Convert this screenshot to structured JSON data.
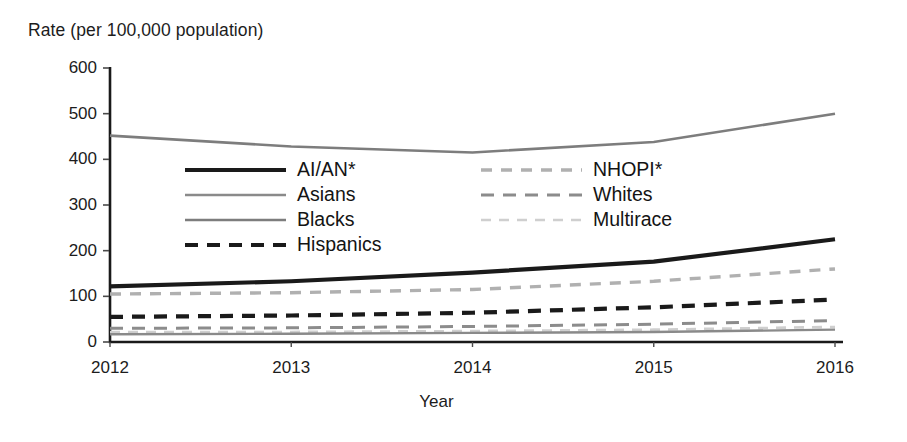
{
  "chart_data": {
    "type": "line",
    "title": "",
    "ylabel": "Rate (per 100,000 population)",
    "xlabel": "Year",
    "x": [
      2012,
      2013,
      2014,
      2015,
      2016
    ],
    "xtick_labels": [
      "2012",
      "2013",
      "2014",
      "2015",
      "2016"
    ],
    "ytick_labels": [
      "600",
      "500",
      "400",
      "300",
      "200",
      "100",
      "0"
    ],
    "ytick_values": [
      600,
      500,
      400,
      300,
      200,
      100,
      0
    ],
    "ylim": [
      0,
      600
    ],
    "xlim": [
      2012,
      2016
    ],
    "grid": false,
    "legend_position": "inside-upper-left",
    "series": [
      {
        "name": "AI/AN*",
        "values": [
          122,
          133,
          152,
          176,
          225
        ],
        "style": "solid",
        "color": "#1a1a1a",
        "width": 4.2
      },
      {
        "name": "Asians",
        "values": [
          17,
          18,
          20,
          22,
          27
        ],
        "style": "solid",
        "color": "#8a8a8a",
        "width": 2.4
      },
      {
        "name": "Blacks",
        "values": [
          452,
          428,
          415,
          438,
          500
        ],
        "style": "solid",
        "color": "#7d7d7d",
        "width": 2.6
      },
      {
        "name": "Hispanics",
        "values": [
          55,
          58,
          64,
          76,
          93
        ],
        "style": "dashed",
        "color": "#1a1a1a",
        "width": 4.2
      },
      {
        "name": "NHOPI*",
        "values": [
          105,
          108,
          115,
          133,
          160
        ],
        "style": "dashed",
        "color": "#b0b0b0",
        "width": 3.4
      },
      {
        "name": "Whites",
        "values": [
          30,
          31,
          34,
          39,
          47
        ],
        "style": "dashed",
        "color": "#8c8c8c",
        "width": 3.0
      },
      {
        "name": "Multirace",
        "values": [
          22,
          22,
          24,
          27,
          33
        ],
        "style": "dashed",
        "color": "#cfcfcf",
        "width": 2.6
      }
    ]
  },
  "legend": {
    "left_column": [
      "AI/AN*",
      "Asians",
      "Blacks",
      "Hispanics"
    ],
    "right_column": [
      "NHOPI*",
      "Whites",
      "Multirace"
    ]
  }
}
